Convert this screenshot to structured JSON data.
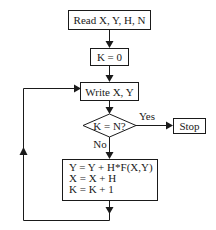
{
  "diagram": {
    "type": "flowchart",
    "nodes": {
      "read": {
        "shape": "process",
        "label": "Read X, Y, H, N"
      },
      "init": {
        "shape": "process",
        "label": "K = 0"
      },
      "write": {
        "shape": "process",
        "label": "Write X, Y"
      },
      "decision": {
        "shape": "decision",
        "label": "K = N?"
      },
      "stop": {
        "shape": "terminal",
        "label": "Stop"
      },
      "update": {
        "shape": "process",
        "lines": [
          "Y = Y + H*F(X,Y)",
          "X = X + H",
          "K = K + 1"
        ]
      }
    },
    "edges": {
      "yes_label": "Yes",
      "no_label": "No"
    },
    "colors": {
      "stroke": "#1a1a1a",
      "background": "#ffffff"
    }
  }
}
